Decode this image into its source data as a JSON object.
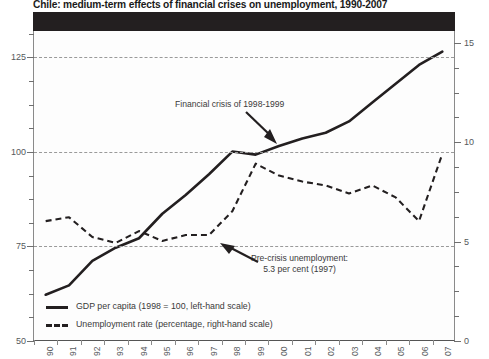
{
  "chart_data": {
    "type": "line",
    "title": "Chile: medium-term effects of financial crises on unemployment, 1990-2007",
    "xlabel": "",
    "ylabel": "",
    "grid": true,
    "legend_position": "bottom-left",
    "x": [
      "90",
      "91",
      "92",
      "93",
      "94",
      "95",
      "96",
      "97",
      "98",
      "99",
      "00",
      "01",
      "02",
      "03",
      "04",
      "05",
      "06",
      "07"
    ],
    "x_tick_labels": [
      "90",
      "91",
      "92",
      "93",
      "94",
      "95",
      "96",
      "97",
      "98",
      "99",
      "00",
      "01",
      "02",
      "03",
      "04",
      "05",
      "06",
      "07"
    ],
    "left_axis": {
      "label": "GDP per capita (1998 = 100)",
      "ylim": [
        50,
        132
      ],
      "ticks": [
        50,
        75,
        100,
        125
      ],
      "tick_labels": [
        "50",
        "75",
        "100",
        "125"
      ],
      "minor_tick_step": 6.25
    },
    "right_axis": {
      "label": "Unemployment rate (percentage)",
      "ylim": [
        0,
        15.6
      ],
      "ticks": [
        0,
        5,
        10,
        15
      ],
      "tick_labels": [
        "0",
        "5",
        "10",
        "15"
      ],
      "minor_tick_step": 1.25
    },
    "series": [
      {
        "name": "GDP per capita (1998 = 100, left-hand scale)",
        "axis": "left",
        "style": "solid",
        "color": "#231f20",
        "values": [
          62.0,
          64.5,
          71.0,
          74.5,
          77.0,
          83.5,
          88.5,
          94.0,
          100.0,
          99.2,
          101.5,
          103.5,
          105.0,
          108.0,
          113.0,
          118.0,
          123.0,
          126.5
        ]
      },
      {
        "name": "Unemployment rate (percentage, right-hand scale)",
        "axis": "right",
        "style": "dashed",
        "color": "#231f20",
        "values": [
          6.0,
          6.2,
          5.2,
          4.9,
          5.5,
          5.0,
          5.3,
          5.3,
          6.5,
          8.9,
          8.3,
          8.0,
          7.8,
          7.4,
          7.8,
          7.2,
          6.0,
          9.4
        ]
      }
    ],
    "annotations": [
      {
        "name": "financial-crisis",
        "lines": [
          "Financial crisis of 1998-1999"
        ],
        "arrow": "points down-right to GDP peak near 1998-1999"
      },
      {
        "name": "pre-crisis-unemployment",
        "lines": [
          "Pre-crisis unemployment:",
          "5.3 per cent (1997)"
        ],
        "arrow": "points up-left to unemployment 5.3 in 1997"
      }
    ],
    "legend": [
      "GDP per capita (1998 = 100, left-hand scale)",
      "Unemployment rate (percentage, right-hand scale)"
    ]
  },
  "colors": {
    "ink": "#231f20",
    "header_bar": "#231f20",
    "grid": "#9a9a9a",
    "axis_text": "#55595c",
    "plot_background": "#fdfdfd"
  }
}
